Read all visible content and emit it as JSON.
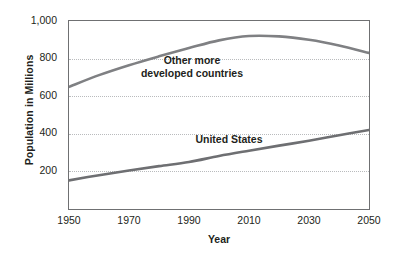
{
  "chart_data": {
    "type": "line",
    "title": "",
    "xlabel": "Year",
    "ylabel": "Population in Millions",
    "xlim": [
      1950,
      2050
    ],
    "ylim": [
      0,
      1000
    ],
    "grid": true,
    "legend_position": "inline-labels",
    "x_ticks": [
      "1950",
      "1970",
      "1990",
      "2010",
      "2030",
      "2050"
    ],
    "x_tick_values": [
      1950,
      1970,
      1990,
      2010,
      2030,
      2050
    ],
    "y_ticks": [
      "200",
      "400",
      "600",
      "800",
      "1,000"
    ],
    "y_tick_values": [
      200,
      400,
      600,
      800,
      1000
    ],
    "x": [
      1950,
      1960,
      1970,
      1980,
      1990,
      2000,
      2010,
      2020,
      2030,
      2040,
      2050
    ],
    "series": [
      {
        "name": "Other more developed countries",
        "label_line1": "Other more",
        "label_line2": "developed countries",
        "color": "#7f8083",
        "values": [
          650,
          712,
          765,
          812,
          856,
          897,
          920,
          918,
          900,
          870,
          830
        ]
      },
      {
        "name": "United States",
        "label_line1": "United States",
        "label_line2": "",
        "color": "#6e6f72",
        "values": [
          152,
          180,
          205,
          228,
          250,
          282,
          310,
          337,
          363,
          392,
          420
        ]
      }
    ]
  }
}
